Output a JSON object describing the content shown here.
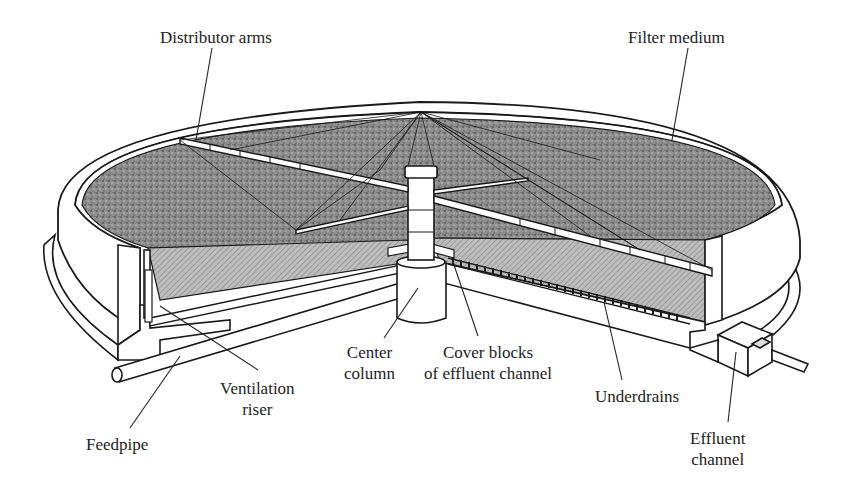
{
  "figure": {
    "colors": {
      "ink": "#1a1a1a",
      "medium_fill": "#8a8a8a",
      "section_fill": "#b4b4b4",
      "wall_fill": "#ffffff",
      "background": "#ffffff"
    }
  },
  "labels": {
    "distributor_arms": {
      "line1": "Distributor arms"
    },
    "filter_medium": {
      "line1": "Filter medium"
    },
    "ventilation_riser": {
      "line1": "Ventilation",
      "line2": "riser"
    },
    "feedpipe": {
      "line1": "Feedpipe"
    },
    "center_column": {
      "line1": "Center",
      "line2": "column"
    },
    "cover_blocks": {
      "line1": "Cover blocks",
      "line2": "of effluent channel"
    },
    "underdrains": {
      "line1": "Underdrains"
    },
    "effluent_channel": {
      "line1": "Effluent",
      "line2": "channel"
    }
  }
}
